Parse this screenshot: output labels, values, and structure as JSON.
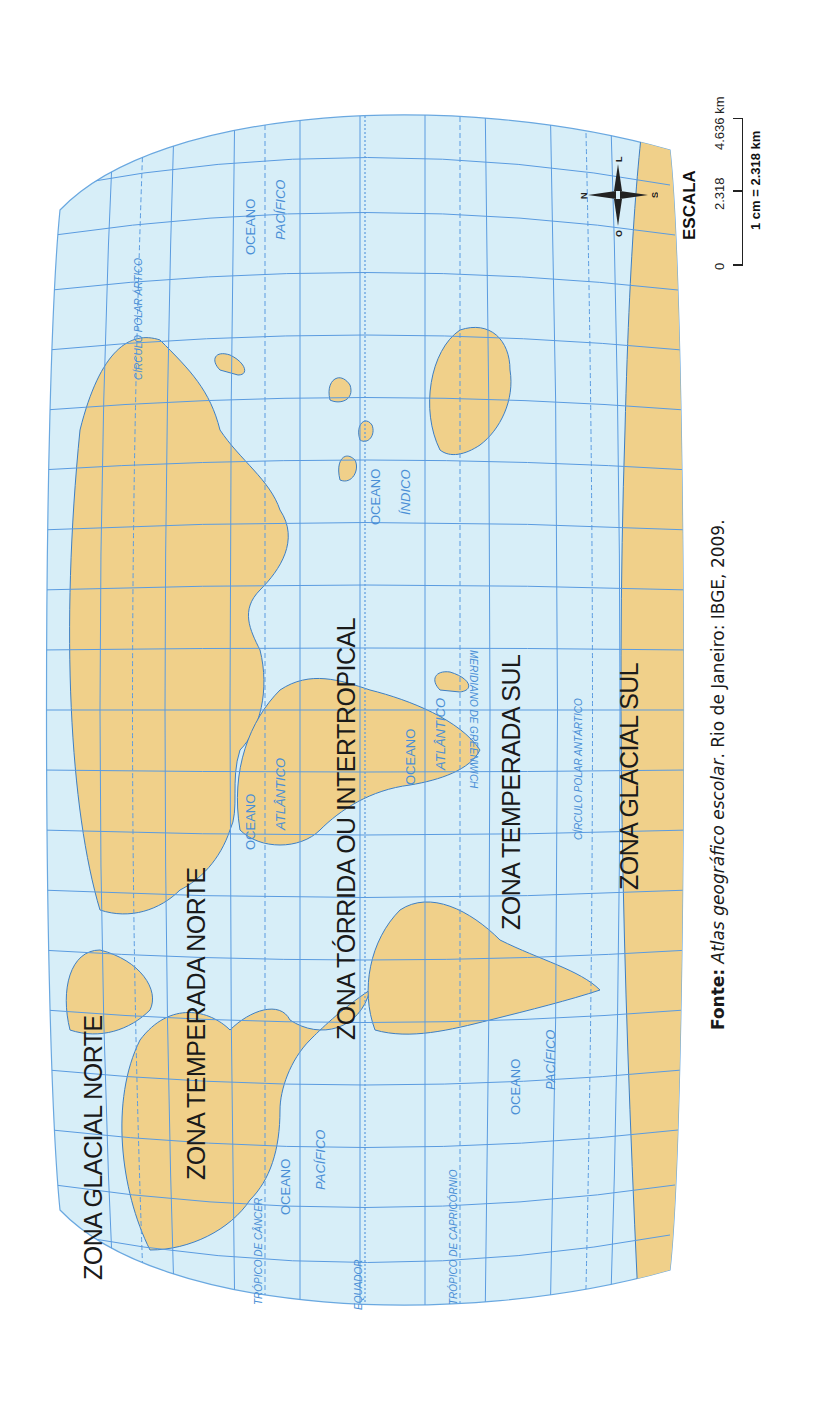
{
  "map": {
    "colors": {
      "ocean": "#d7eef8",
      "land": "#f0d08a",
      "coastline": "#3d7fc4",
      "graticule": "#5a9be0",
      "zone_text": "#1a1a1a",
      "label_text": "#4a8fd6"
    },
    "zones": {
      "glacial_norte": "ZONA GLACIAL NORTE",
      "temperada_norte": "ZONA TEMPERADA NORTE",
      "torrida": "ZONA TÓRRIDA OU INTERTROPICAL",
      "temperada_sul": "ZONA TEMPERADA SUL",
      "glacial_sul": "ZONA  GLACIAL  SUL"
    },
    "oceans": {
      "pacifico_norte_oeste": [
        "OCEANO",
        "PACÍFICO"
      ],
      "pacifico_sul_oeste": [
        "OCEANO",
        "PACÍFICO"
      ],
      "atlantico_norte": [
        "OCEANO",
        "ATLÂNTICO"
      ],
      "atlantico_sul": [
        "OCEANO",
        "ATLÂNTICO"
      ],
      "indico": [
        "OCEANO",
        "ÍNDICO"
      ],
      "pacifico_leste": [
        "OCEANO",
        "PACÍFICO"
      ]
    },
    "lines": {
      "circulo_polar_artico": "CÍRCULO POLAR ÁRTICO",
      "tropico_cancer": "TRÓPICO DE CÂNCER",
      "equador": "EQUADOR",
      "tropico_capricornio": "TRÓPICO DE CAPRICÓRNIO",
      "circulo_polar_antartico": "CÍRCULO POLAR ANTÁRTICO",
      "meridiano_greenwich": "MERIDIANO DE GREENWICH"
    }
  },
  "compass": {
    "n": "N",
    "s": "S",
    "l": "L",
    "o": "O"
  },
  "scale": {
    "title": "ESCALA",
    "ticks": [
      "0",
      "2.318",
      "4.636 km"
    ],
    "unit": "1 cm = 2.318 km"
  },
  "source": {
    "label": "Fonte:",
    "title": "Atlas geográfico escolar",
    "rest": ". Rio de Janeiro: IBGE, 2009."
  }
}
